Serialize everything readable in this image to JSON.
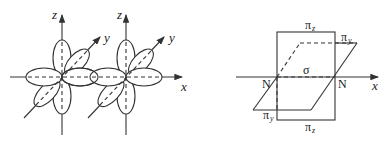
{
  "figure": {
    "left_panel": {
      "description": "Two nitrogen atoms each with three p orbitals (px, py, pz) along x-axis",
      "axes": {
        "x_label": "x",
        "z_labels": [
          "z",
          "z"
        ],
        "y_labels": [
          "y",
          "y"
        ]
      }
    },
    "right_panel": {
      "description": "Bonding in N2: one sigma bond and two pi bonds",
      "axis_label": "x",
      "atoms": [
        "N",
        "N"
      ],
      "sigma_label": "σ",
      "pi_labels": {
        "pi_z_top": "π",
        "pi_z_top_sub": "z",
        "pi_z_bottom": "π",
        "pi_z_bottom_sub": "z",
        "pi_y_right": "π",
        "pi_y_right_sub": "y",
        "pi_y_left": "π",
        "pi_y_left_sub": "y"
      }
    }
  },
  "colors": {
    "stroke": "#333333",
    "background": "#ffffff"
  }
}
